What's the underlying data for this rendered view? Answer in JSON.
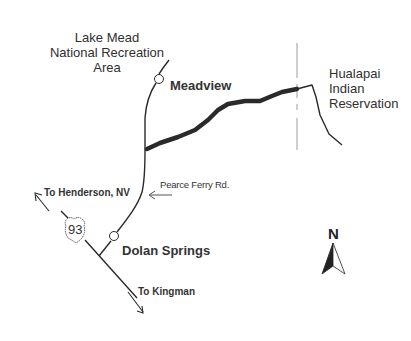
{
  "map": {
    "title": "Dolan Springs / Meadview area map",
    "regions": {
      "lake_mead": [
        "Lake Mead",
        "National Recreation",
        "Area"
      ],
      "hualapai": [
        "Hualapai",
        "Indian",
        "Reservation"
      ]
    },
    "towns": {
      "meadview": "Meadview",
      "dolan_springs": "Dolan Springs"
    },
    "roads": {
      "pearce_ferry": "Pearce Ferry Rd.",
      "route_shield": "93"
    },
    "directions": {
      "henderson": "To Henderson, NV",
      "kingman": "To Kingman"
    },
    "compass": {
      "north": "N"
    },
    "colors": {
      "background": "#ffffff",
      "line": "#2a2a2a",
      "boundary": "#9a9a9a"
    }
  }
}
